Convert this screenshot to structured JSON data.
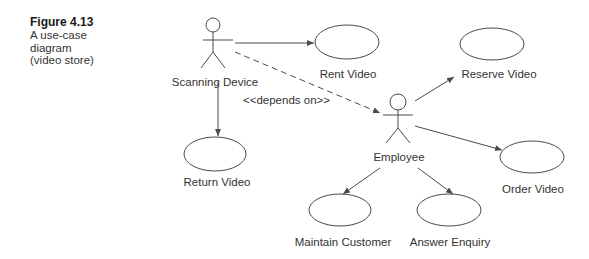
{
  "caption": {
    "title": "Figure 4.13",
    "lines": [
      "A use-case",
      "diagram",
      "(video store)"
    ]
  },
  "actors": [
    {
      "id": "scanning_device",
      "label": "Scanning Device"
    },
    {
      "id": "employee",
      "label": "Employee"
    }
  ],
  "use_cases": [
    {
      "id": "rent_video",
      "label": "Rent Video"
    },
    {
      "id": "reserve_video",
      "label": "Reserve Video"
    },
    {
      "id": "return_video",
      "label": "Return Video"
    },
    {
      "id": "order_video",
      "label": "Order Video"
    },
    {
      "id": "maintain_customer",
      "label": "Maintain Customer"
    },
    {
      "id": "answer_enquiry",
      "label": "Answer Enquiry"
    }
  ],
  "relationships": [
    {
      "from": "scanning_device",
      "to": "rent_video",
      "style": "solid"
    },
    {
      "from": "scanning_device",
      "to": "return_video",
      "style": "solid"
    },
    {
      "from": "scanning_device",
      "to": "employee",
      "style": "dashed",
      "label": "<<depends on>>"
    },
    {
      "from": "employee",
      "to": "reserve_video",
      "style": "solid"
    },
    {
      "from": "employee",
      "to": "order_video",
      "style": "solid"
    },
    {
      "from": "employee",
      "to": "maintain_customer",
      "style": "solid"
    },
    {
      "from": "employee",
      "to": "answer_enquiry",
      "style": "solid"
    }
  ],
  "colors": {
    "line": "#4a4a4a",
    "text": "#333333"
  }
}
